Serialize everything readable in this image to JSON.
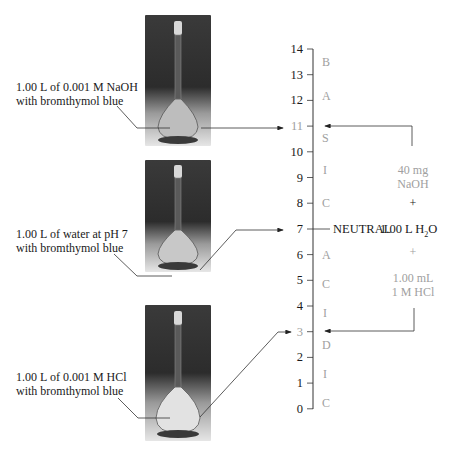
{
  "flasks": [
    {
      "label_line1": "1.00 L of 0.001 M NaOH",
      "label_line2": "with bromthymol blue",
      "points_to_ph": 11
    },
    {
      "label_line1": "1.00 L of water at pH 7",
      "label_line2": "with bromthymol blue",
      "points_to_ph": 7
    },
    {
      "label_line1": "1.00 L of 0.001 M HCl",
      "label_line2": "with bromthymol blue",
      "points_to_ph": 3
    }
  ],
  "ph_scale": {
    "ticks": [
      "14",
      "13",
      "12",
      "11",
      "10",
      "9",
      "8",
      "7",
      "6",
      "5",
      "4",
      "3",
      "2",
      "1",
      "0"
    ],
    "basic_letters": [
      "B",
      "A",
      "S",
      "I",
      "C"
    ],
    "acidic_letters": [
      "A",
      "C",
      "I",
      "D",
      "I",
      "C"
    ],
    "neutral_label": "NEUTRAL"
  },
  "additions": {
    "top_line1": "40 mg",
    "top_line2": "NaOH",
    "plus1": "+",
    "water": "1.00 L H",
    "water_sub": "2",
    "water_end": "O",
    "plus2": "+",
    "bottom_line1": "1.00 mL",
    "bottom_line2": "1 M HCl"
  },
  "colors": {
    "gray_text": "#a0a0a0",
    "line": "#333333"
  }
}
